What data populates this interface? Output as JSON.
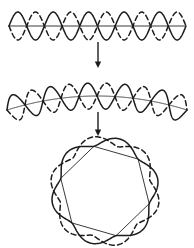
{
  "figure": {
    "background_color": "#ffffff",
    "stroke_color": "#1c1c1c",
    "axis_color": "#3a3a3a",
    "stages": [
      {
        "id": "stage-straight",
        "label": "straight wave",
        "axis_type": "straight-line",
        "axis_start": [
          9,
          26
        ],
        "axis_end": [
          186,
          26
        ],
        "cycles": 5,
        "amplitude": 14,
        "curves": [
          {
            "name": "solid-sine",
            "style": "solid",
            "phase_deg": 0
          },
          {
            "name": "dashed-sine",
            "style": "dashed",
            "phase_deg": 180
          }
        ]
      },
      {
        "id": "stage-bent",
        "label": "partially bent wave",
        "axis_type": "shallow-arc",
        "axis_start": [
          7,
          110
        ],
        "axis_end": [
          187,
          110
        ],
        "arc_rise": 14,
        "cycles": 5,
        "amplitude": 13,
        "curves": [
          {
            "name": "solid-sine",
            "style": "solid",
            "phase_deg": 0
          },
          {
            "name": "dashed-sine",
            "style": "dashed",
            "phase_deg": 180
          }
        ]
      },
      {
        "id": "stage-ring",
        "label": "closed ring",
        "axis_type": "inscribed-polygon",
        "center": [
          105,
          191
        ],
        "radius": 46,
        "vertices": 6,
        "rotation_deg": -104,
        "bulge": 13,
        "curves": [
          {
            "name": "solid-arc-set",
            "style": "solid",
            "phase_deg": 0
          },
          {
            "name": "dashed-arc-set",
            "style": "dashed",
            "phase_deg": 180
          }
        ]
      }
    ],
    "arrows": [
      {
        "id": "arrow-top",
        "direction": "down",
        "x": 98,
        "y_start": 42,
        "y_end": 68
      },
      {
        "id": "arrow-bottom",
        "direction": "down",
        "x": 98,
        "y_start": 112,
        "y_end": 136
      }
    ]
  }
}
